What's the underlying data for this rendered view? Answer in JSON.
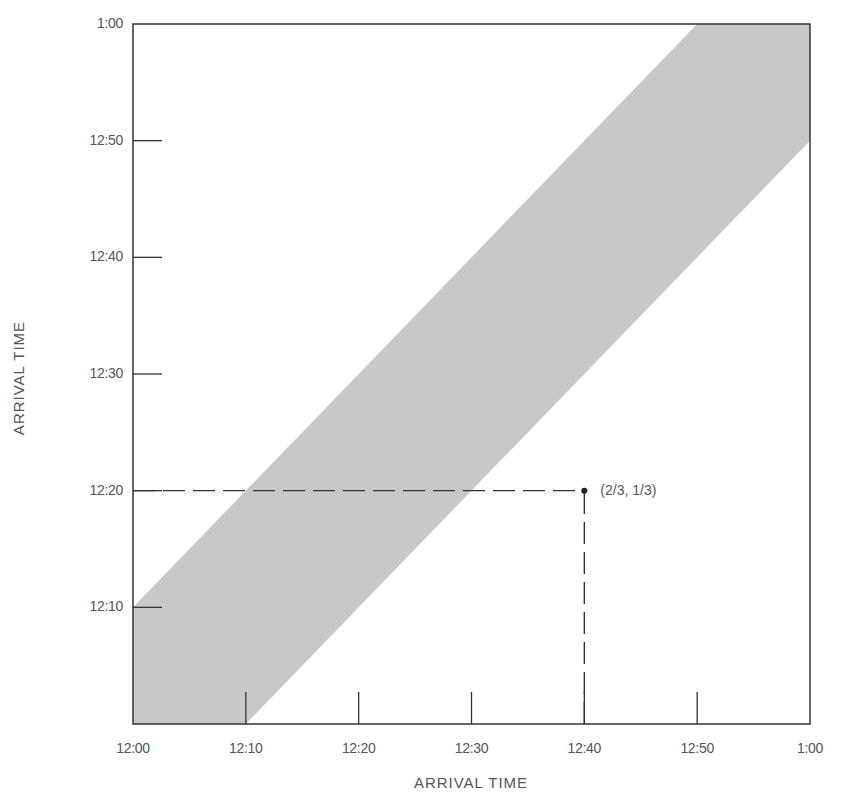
{
  "chart_data": {
    "type": "area",
    "title": "",
    "xlabel": "ARRIVAL TIME",
    "ylabel": "ARRIVAL TIME",
    "x_ticks": [
      "12:00",
      "12:10",
      "12:20",
      "12:30",
      "12:40",
      "12:50",
      "1:00"
    ],
    "y_ticks": [
      "12:10",
      "12:20",
      "12:30",
      "12:40",
      "12:50",
      "1:00"
    ],
    "xlim": [
      0,
      60
    ],
    "ylim": [
      0,
      60
    ],
    "units": "minutes after 12:00",
    "grid": false,
    "legend": null,
    "shaded_region": {
      "description": "Band where the two arrival times differ by at most 10 minutes (|x - y| <= 10)",
      "polygon": [
        [
          0,
          0
        ],
        [
          10,
          0
        ],
        [
          60,
          50
        ],
        [
          60,
          60
        ],
        [
          50,
          60
        ],
        [
          0,
          10
        ]
      ],
      "color": "#c8c8c8"
    },
    "point": {
      "x": 40,
      "y": 20,
      "label": "(2/3, 1/3)"
    },
    "guide_lines": [
      {
        "style": "dashed",
        "from": [
          0,
          20
        ],
        "to": [
          40,
          20
        ]
      },
      {
        "style": "dashed",
        "from": [
          40,
          0
        ],
        "to": [
          40,
          20
        ]
      }
    ]
  },
  "labels": {
    "x_axis_title": "ARRIVAL TIME",
    "y_axis_title": "ARRIVAL TIME",
    "point_label": "(2/3, 1/3)",
    "x_ticks": [
      "12:00",
      "12:10",
      "12:20",
      "12:30",
      "12:40",
      "12:50",
      "1:00"
    ],
    "y_ticks": [
      "12:10",
      "12:20",
      "12:30",
      "12:40",
      "12:50",
      "1:00"
    ]
  },
  "colors": {
    "band": "#c8c8c8",
    "axis": "#333333",
    "text": "#555555"
  }
}
